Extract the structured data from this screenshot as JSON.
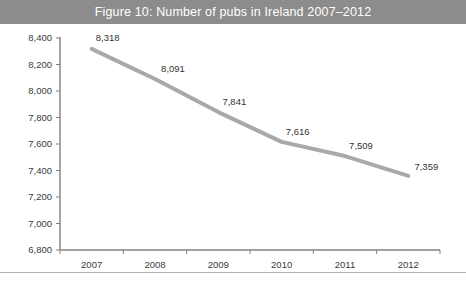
{
  "figure": {
    "title": "Figure 10: Number of pubs in Ireland 2007–2012",
    "title_bar_color": "#8c8c8c",
    "title_text_color": "#ffffff",
    "background_color": "#ffffff"
  },
  "chart_data": {
    "type": "line",
    "title": "Figure 10: Number of pubs in Ireland 2007–2012",
    "xlabel": "",
    "ylabel": "",
    "categories": [
      "2007",
      "2008",
      "2009",
      "2010",
      "2011",
      "2012"
    ],
    "values": [
      8318,
      8091,
      7841,
      7616,
      7509,
      7359
    ],
    "point_labels": [
      "8,318",
      "8,091",
      "7,841",
      "7,616",
      "7,509",
      "7,359"
    ],
    "ylim": [
      6800,
      8400
    ],
    "ytick_values": [
      8400,
      8200,
      8000,
      7800,
      7600,
      7400,
      7200,
      7000,
      6800
    ],
    "ytick_labels": [
      "8,400",
      "8,200",
      "8,000",
      "7,800",
      "7,600",
      "7,400",
      "7,200",
      "7,000",
      "6,800"
    ],
    "grid": false,
    "legend": false,
    "legend_position": "none",
    "series": [
      {
        "name": "Number of pubs",
        "color": "#a9a9a9",
        "line_width": 4,
        "values": [
          8318,
          8091,
          7841,
          7616,
          7509,
          7359
        ]
      }
    ],
    "axis_color": "#808080",
    "tick_label_color": "#3a3a3a"
  }
}
